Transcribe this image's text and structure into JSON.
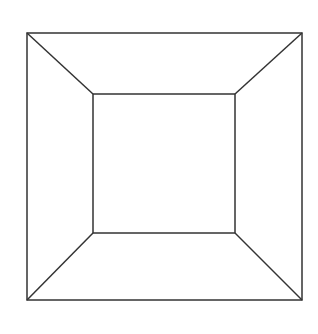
{
  "diagram": {
    "type": "line-drawing",
    "canvas": {
      "width": 318,
      "height": 334,
      "background": "#ffffff"
    },
    "stroke": {
      "color": "#333333",
      "width": 1.5
    },
    "outer_square": {
      "x1": 27,
      "y1": 33,
      "x2": 302,
      "y2": 300
    },
    "inner_square": {
      "x1": 93,
      "y1": 94,
      "x2": 235,
      "y2": 233
    },
    "connectors": [
      {
        "name": "top-left",
        "from": [
          27,
          33
        ],
        "to": [
          93,
          94
        ]
      },
      {
        "name": "top-right",
        "from": [
          302,
          33
        ],
        "to": [
          235,
          94
        ]
      },
      {
        "name": "bottom-right",
        "from": [
          302,
          300
        ],
        "to": [
          235,
          233
        ]
      },
      {
        "name": "bottom-left",
        "from": [
          27,
          300
        ],
        "to": [
          93,
          233
        ]
      }
    ]
  }
}
